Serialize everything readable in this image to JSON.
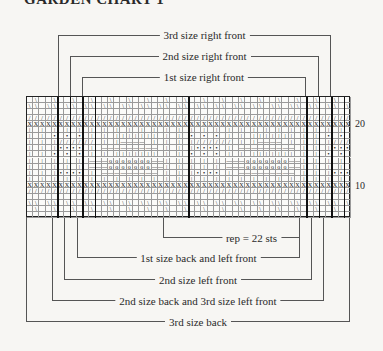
{
  "title": "GARDEN CHART 1",
  "top_brackets": [
    {
      "label": "3rd size right front",
      "left": 58,
      "right": 331,
      "y": 35
    },
    {
      "label": "2nd size right front",
      "left": 70,
      "right": 319,
      "y": 56
    },
    {
      "label": "1st size right front",
      "left": 82,
      "right": 306,
      "y": 77
    }
  ],
  "bottom_brackets": [
    {
      "label": "rep = 22 sts",
      "left": 163,
      "right": 300,
      "y": 238
    },
    {
      "label": "1st size back and left front",
      "left": 77,
      "right": 300,
      "y": 258
    },
    {
      "label": "2nd size left front",
      "left": 64,
      "right": 312,
      "y": 280
    },
    {
      "label": "2nd size back and 3rd size left front",
      "left": 52,
      "right": 324,
      "y": 301
    },
    {
      "label": "3rd size back",
      "left": 26,
      "right": 350,
      "y": 322
    }
  ],
  "grid": {
    "columns": 52,
    "rows": 20,
    "row_labels": [
      {
        "text": "20",
        "row": 20
      },
      {
        "text": "10",
        "row": 10
      }
    ],
    "heavy_column_lines": [
      5,
      7,
      9,
      11,
      26,
      45,
      47,
      49,
      51
    ],
    "row_patterns": [
      "diag2",
      "diag1",
      "blank",
      "slash",
      "cross",
      "vert",
      "dots",
      "diagbody",
      "dash",
      "dots",
      "circle",
      "circle",
      "dash",
      "vert",
      "cross",
      "slash",
      "blank",
      "diag1",
      "diag2",
      "blank"
    ]
  },
  "symbols": {
    "diag": "\\",
    "slash": "/",
    "cross": "X",
    "vert": "|",
    "dot": "•",
    "dash": "—",
    "circle": "o"
  }
}
